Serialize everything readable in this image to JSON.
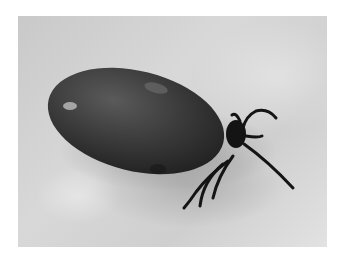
{
  "image": {
    "subject": "engorged tick on skin",
    "alt": "Black-and-white photograph of an engorged tick with legs visible on a textured light surface",
    "colors": {
      "background": "#ffffff",
      "surface": "#d0d0d0",
      "body": "#3a3a3a",
      "legs": "#151515"
    }
  }
}
